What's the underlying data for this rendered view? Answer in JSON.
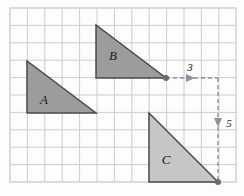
{
  "figure": {
    "background_color": "#fdfdfd",
    "grid": {
      "line_color": "#c9cdd2",
      "spacing": 17.4,
      "origin_x": 10,
      "origin_y": 8,
      "columns": 13,
      "rows": 10,
      "border_color": "#d8dade"
    },
    "triangles": [
      {
        "id": "A",
        "label": "A",
        "label_x": 44,
        "label_y": 104,
        "fill": "#9c9c9c",
        "stroke": "#4a4a4a",
        "points": "27,61 27,113 96,113",
        "right_angle_corner": "bottom-left",
        "width_units": 4,
        "height_units": 3
      },
      {
        "id": "B",
        "label": "B",
        "label_x": 113,
        "label_y": 60,
        "fill": "#9c9c9c",
        "stroke": "#4a4a4a",
        "points": "96,25 96,78 166,78",
        "right_angle_corner": "bottom-left",
        "width_units": 4,
        "height_units": 3
      },
      {
        "id": "C",
        "label": "C",
        "label_x": 166,
        "label_y": 164,
        "fill": "#c6c6c6",
        "stroke": "#4a4a4a",
        "points": "149,113 149,182 218,182",
        "right_angle_corner": "bottom-left",
        "width_units": 4,
        "height_units": 4
      }
    ],
    "vertex_dots": [
      {
        "name": "triangle-b-corner-dot",
        "x": 166,
        "y": 78,
        "r": 3.0,
        "color": "#6a6a6a"
      },
      {
        "name": "triangle-c-corner-dot",
        "x": 218,
        "y": 182,
        "r": 3.0,
        "color": "#6a6a6a"
      }
    ],
    "translation_arrows": [
      {
        "name": "horizontal-translation",
        "label": "3",
        "label_x": 190,
        "label_y": 71,
        "direction": "right",
        "dash_color": "#8f9399",
        "from_x": 166,
        "from_y": 78,
        "to_x": 218,
        "to_y": 78,
        "arrowhead_x": 192,
        "arrowhead_y": 78
      },
      {
        "name": "vertical-translation",
        "label": "5",
        "label_x": 229,
        "label_y": 127,
        "direction": "down",
        "dash_color": "#8f9399",
        "from_x": 218,
        "from_y": 78,
        "to_x": 218,
        "to_y": 182,
        "arrowhead_x": 218,
        "arrowhead_y": 124
      }
    ],
    "dash_pattern": "4,3"
  }
}
